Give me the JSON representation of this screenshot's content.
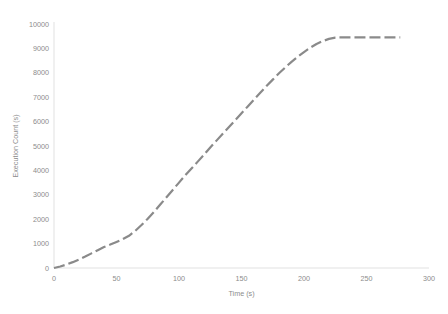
{
  "chart_data": {
    "type": "line",
    "title": "",
    "xlabel": "Time (s)",
    "ylabel": "Execution Count (s)",
    "xlim": [
      0,
      300
    ],
    "ylim": [
      0,
      10000
    ],
    "xticks": [
      0,
      50,
      100,
      150,
      200,
      250,
      300
    ],
    "xtick_labels": [
      "0",
      "50",
      "100",
      "150",
      "200",
      "250",
      "300"
    ],
    "yticks": [
      0,
      1000,
      2000,
      3000,
      4000,
      5000,
      6000,
      7000,
      8000,
      9000,
      10000
    ],
    "ytick_labels": [
      "0",
      "1000",
      "2000",
      "3000",
      "4000",
      "5000",
      "6000",
      "7000",
      "8000",
      "9000",
      "10000"
    ],
    "grid": false,
    "legend": null,
    "line_style": "dashed",
    "line_color": "#8a8a8a",
    "series": [
      {
        "name": "Execution Count",
        "x": [
          0,
          5,
          10,
          15,
          20,
          25,
          30,
          35,
          40,
          45,
          50,
          55,
          60,
          65,
          70,
          75,
          80,
          85,
          90,
          95,
          100,
          105,
          110,
          115,
          120,
          125,
          130,
          135,
          140,
          145,
          150,
          155,
          160,
          165,
          170,
          175,
          180,
          185,
          190,
          195,
          200,
          205,
          210,
          215,
          220,
          225,
          228,
          235,
          245,
          255,
          265,
          277
        ],
        "y": [
          0,
          60,
          140,
          240,
          350,
          470,
          600,
          730,
          860,
          960,
          1070,
          1180,
          1320,
          1520,
          1760,
          2020,
          2300,
          2600,
          2900,
          3200,
          3500,
          3800,
          4080,
          4360,
          4640,
          4940,
          5220,
          5500,
          5780,
          6060,
          6340,
          6620,
          6900,
          7180,
          7460,
          7720,
          7980,
          8220,
          8450,
          8660,
          8850,
          9030,
          9180,
          9300,
          9390,
          9440,
          9450,
          9450,
          9450,
          9450,
          9450,
          9450
        ]
      }
    ]
  },
  "axes": {
    "y_axis_title": "Execution Count (s)",
    "x_axis_title": "Time (s)"
  }
}
